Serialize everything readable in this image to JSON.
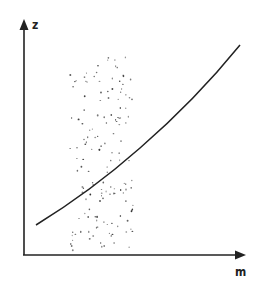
{
  "diagram": {
    "type": "schematic curve with shaded band",
    "axes": {
      "x_label": "m",
      "y_label": "z"
    },
    "curve": {
      "description": "monotonically increasing convex curve",
      "points_px": [
        [
          36,
          225
        ],
        [
          70,
          202
        ],
        [
          120,
          163
        ],
        [
          160,
          130
        ],
        [
          200,
          85
        ],
        [
          240,
          45
        ]
      ]
    },
    "band": {
      "description": "vertical stippled (dotted) region",
      "x_range_px": [
        70,
        133
      ],
      "y_range_px": [
        55,
        252
      ]
    },
    "colors": {
      "line": "#222222",
      "background": "#ffffff",
      "dots": "#333333"
    }
  }
}
